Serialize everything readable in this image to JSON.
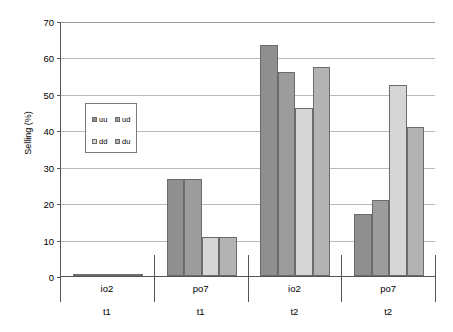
{
  "chart_data": {
    "type": "bar",
    "title": "",
    "xlabel": "",
    "ylabel": "Selling (%)",
    "ylim": [
      0,
      70
    ],
    "ytick_step": 10,
    "yticks": [
      0,
      10,
      20,
      30,
      40,
      50,
      60,
      70
    ],
    "grid": true,
    "legend_position": "inside-upper-left",
    "categories": [
      "io2",
      "po7",
      "io2",
      "po7"
    ],
    "category_sublabels": [
      "t1",
      "t1",
      "t2",
      "t2"
    ],
    "series": [
      {
        "name": "uu",
        "color": "#8f8f8f",
        "values": [
          0.3,
          26.5,
          63.5,
          17.0
        ]
      },
      {
        "name": "ud",
        "color": "#9c9c9c",
        "values": [
          0.4,
          26.6,
          56.0,
          21.0
        ]
      },
      {
        "name": "dd",
        "color": "#d6d6d6",
        "values": [
          0.3,
          10.6,
          46.0,
          52.3
        ]
      },
      {
        "name": "du",
        "color": "#b3b3b3",
        "values": [
          0.5,
          10.7,
          57.5,
          41.0
        ]
      }
    ],
    "legend_entries": [
      {
        "label": "uu",
        "color": "#8f8f8f"
      },
      {
        "label": "ud",
        "color": "#9c9c9c"
      },
      {
        "label": "dd",
        "color": "#d6d6d6"
      },
      {
        "label": "du",
        "color": "#b3b3b3"
      }
    ]
  }
}
